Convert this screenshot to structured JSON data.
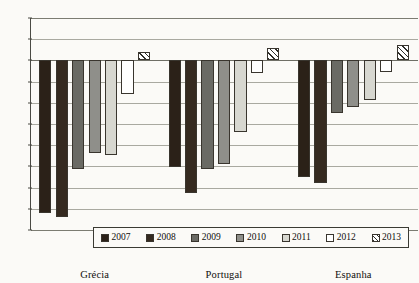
{
  "chart_data": {
    "type": "bar",
    "title": "",
    "subtitle": "",
    "xlabel": "",
    "ylabel": "",
    "categories": [
      "Grécia",
      "Portugal",
      "Espanha"
    ],
    "series": [
      {
        "name": "2007",
        "color": "#2b2118",
        "values": [
          -14.4,
          -10.1,
          -11.0
        ]
      },
      {
        "name": "2008",
        "color": "#352a20",
        "values": [
          -14.8,
          -12.5,
          -11.6
        ]
      },
      {
        "name": "2009",
        "color": "#6a6a64",
        "values": [
          -10.2,
          -10.2,
          -5.0
        ]
      },
      {
        "name": "2010",
        "color": "#8f8f8a",
        "values": [
          -8.7,
          -9.8,
          -4.4
        ]
      },
      {
        "name": "2011",
        "color": "#d7d7d0",
        "values": [
          -8.9,
          -6.8,
          -3.7
        ]
      },
      {
        "name": "2012",
        "color": "#ffffff",
        "values": [
          -3.2,
          -1.2,
          -1.1
        ]
      },
      {
        "name": "2013",
        "color": "hatched",
        "values": [
          0.8,
          1.2,
          1.5
        ]
      }
    ],
    "ylim": [
      -16,
      4
    ],
    "yticks": [
      4,
      2,
      0,
      -2,
      -4,
      -6,
      -8,
      -10,
      -12,
      -14,
      -16
    ],
    "ytick_labels": [
      "4",
      "2",
      "0",
      "-2",
      "-4",
      "-6",
      "-8",
      "-10",
      "-12",
      "-14",
      "-16"
    ],
    "grid": true,
    "legend_position": "bottom"
  },
  "legend": {
    "items": [
      {
        "label": "2007"
      },
      {
        "label": "2008"
      },
      {
        "label": "2009"
      },
      {
        "label": "2010"
      },
      {
        "label": "2011"
      },
      {
        "label": "2012"
      },
      {
        "label": "2013"
      }
    ]
  }
}
